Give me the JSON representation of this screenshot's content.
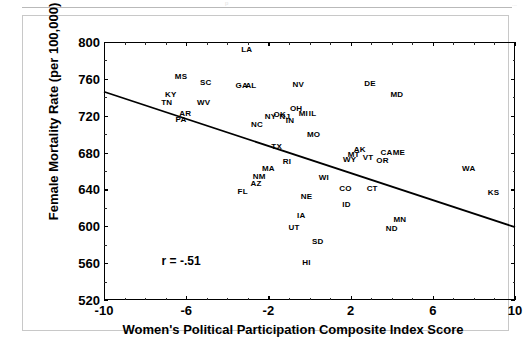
{
  "page": {
    "header_ghost_left": "p",
    "header_ghost_right": "..."
  },
  "chart_data": {
    "type": "scatter",
    "title": "",
    "xlabel": "Women's Political Participation Composite Index Score",
    "ylabel": "Female Mortality Rate (per 100,000)",
    "xlim": [
      -10,
      10
    ],
    "ylim": [
      520,
      800
    ],
    "xticks": [
      -10,
      -6,
      -2,
      2,
      6,
      10
    ],
    "xtick_labels": [
      "-10",
      "-6",
      "-2",
      "2",
      "6",
      "10"
    ],
    "xticks_minor": [
      -9,
      -8,
      -7,
      -5,
      -4,
      -3,
      -1,
      0,
      1,
      3,
      4,
      5,
      7,
      8,
      9
    ],
    "yticks": [
      520,
      560,
      600,
      640,
      680,
      720,
      760,
      800
    ],
    "ytick_labels": [
      "520",
      "560",
      "600",
      "640",
      "680",
      "720",
      "760",
      "800"
    ],
    "yticks_minor": [
      540,
      580,
      620,
      660,
      700,
      740,
      780
    ],
    "grid": false,
    "legend": null,
    "annotations": [
      {
        "name": "correlation",
        "text": "r = -.51",
        "x": -6.25,
        "y": 562
      }
    ],
    "regression_line": {
      "x_start": -10,
      "y_start": 746,
      "x_end": 10,
      "y_end": 599,
      "color": "#000000"
    },
    "marker_style": "state-abbreviation-text",
    "points": [
      {
        "label": "LA",
        "x": -3.05,
        "y": 791
      },
      {
        "label": "MS",
        "x": -6.25,
        "y": 762
      },
      {
        "label": "SC",
        "x": -5.05,
        "y": 755
      },
      {
        "label": "GA",
        "x": -3.3,
        "y": 752
      },
      {
        "label": "AL",
        "x": -2.85,
        "y": 752
      },
      {
        "label": "NV",
        "x": -0.55,
        "y": 753
      },
      {
        "label": "DE",
        "x": 2.95,
        "y": 754
      },
      {
        "label": "KY",
        "x": -6.75,
        "y": 742
      },
      {
        "label": "MD",
        "x": 4.25,
        "y": 742
      },
      {
        "label": "TN",
        "x": -6.95,
        "y": 734
      },
      {
        "label": "WV",
        "x": -5.15,
        "y": 734
      },
      {
        "label": "OH",
        "x": -0.65,
        "y": 727
      },
      {
        "label": "AR",
        "x": -6.05,
        "y": 722
      },
      {
        "label": "NY",
        "x": -1.9,
        "y": 719
      },
      {
        "label": "OK",
        "x": -1.45,
        "y": 721
      },
      {
        "label": "NJ",
        "x": -1.2,
        "y": 719
      },
      {
        "label": "MI",
        "x": -0.3,
        "y": 722
      },
      {
        "label": "IL",
        "x": 0.15,
        "y": 722
      },
      {
        "label": "PA",
        "x": -6.25,
        "y": 715
      },
      {
        "label": "IN",
        "x": -0.95,
        "y": 714
      },
      {
        "label": "NC",
        "x": -2.55,
        "y": 710
      },
      {
        "label": "MO",
        "x": 0.2,
        "y": 699
      },
      {
        "label": "TX",
        "x": -1.6,
        "y": 686
      },
      {
        "label": "AK",
        "x": 2.45,
        "y": 683
      },
      {
        "label": "CA",
        "x": 3.75,
        "y": 679
      },
      {
        "label": "ME",
        "x": 4.35,
        "y": 679
      },
      {
        "label": "MT",
        "x": 2.15,
        "y": 677
      },
      {
        "label": "VT",
        "x": 2.85,
        "y": 674
      },
      {
        "label": "WY",
        "x": 1.95,
        "y": 672
      },
      {
        "label": "OR",
        "x": 3.55,
        "y": 671
      },
      {
        "label": "RI",
        "x": -1.1,
        "y": 670
      },
      {
        "label": "MA",
        "x": -2.0,
        "y": 662
      },
      {
        "label": "WA",
        "x": 7.75,
        "y": 662
      },
      {
        "label": "NM",
        "x": -2.45,
        "y": 654
      },
      {
        "label": "WI",
        "x": 0.7,
        "y": 652
      },
      {
        "label": "AZ",
        "x": -2.6,
        "y": 646
      },
      {
        "label": "CO",
        "x": 1.75,
        "y": 641
      },
      {
        "label": "CT",
        "x": 3.05,
        "y": 640
      },
      {
        "label": "FL",
        "x": -3.25,
        "y": 637
      },
      {
        "label": "KS",
        "x": 8.95,
        "y": 636
      },
      {
        "label": "NE",
        "x": -0.15,
        "y": 632
      },
      {
        "label": "ID",
        "x": 1.8,
        "y": 623
      },
      {
        "label": "IA",
        "x": -0.4,
        "y": 611
      },
      {
        "label": "MN",
        "x": 4.4,
        "y": 607
      },
      {
        "label": "UT",
        "x": -0.75,
        "y": 598
      },
      {
        "label": "ND",
        "x": 4.0,
        "y": 597
      },
      {
        "label": "SD",
        "x": 0.4,
        "y": 583
      },
      {
        "label": "HI",
        "x": -0.15,
        "y": 560
      }
    ]
  }
}
